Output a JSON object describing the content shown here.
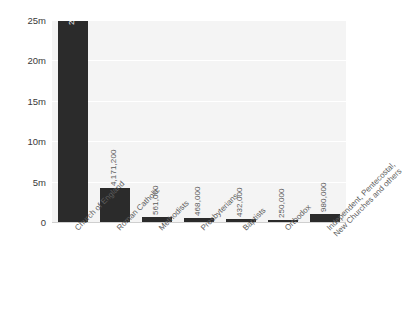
{
  "chart_data": {
    "type": "bar",
    "title": "",
    "subtitle": "",
    "xlabel": "",
    "ylabel": "",
    "ylim": [
      0,
      25000000
    ],
    "grid": true,
    "legend": null,
    "orientation": "vertical",
    "categories": [
      "Church of England",
      "Roman Catholic",
      "Methodists",
      "Presbyterians",
      "Baptists",
      "Orthodox",
      "Independent, Pentecostal, New Churches and others"
    ],
    "category_lines": [
      [
        "Church of England"
      ],
      [
        "Roman Catholic"
      ],
      [
        "Methodists"
      ],
      [
        "Presbyterians"
      ],
      [
        "Baptists"
      ],
      [
        "Orthodox"
      ],
      [
        "Independent, Pentecostal,",
        "New Churches and others"
      ]
    ],
    "values": [
      24841000,
      4171200,
      561000,
      468000,
      432000,
      250000,
      980000
    ],
    "value_labels": [
      "24,841,000",
      "4,171,200",
      "561,000",
      "468,000",
      "432,000",
      "250,000",
      "980,000"
    ],
    "yticks": [
      0,
      5000000,
      10000000,
      15000000,
      20000000,
      25000000
    ],
    "ytick_labels": [
      "0",
      "5m",
      "10m",
      "15m",
      "20m",
      "25m"
    ],
    "colors": {
      "bar": "#2b2b2b",
      "plot_background": "#f4f4f4",
      "canvas_background": "#ffffff",
      "gridline": "#ffffff",
      "axis_text": "#3a3a3a",
      "value_label": "#5a5a5a",
      "value_label_inside": "#ffffff"
    }
  }
}
